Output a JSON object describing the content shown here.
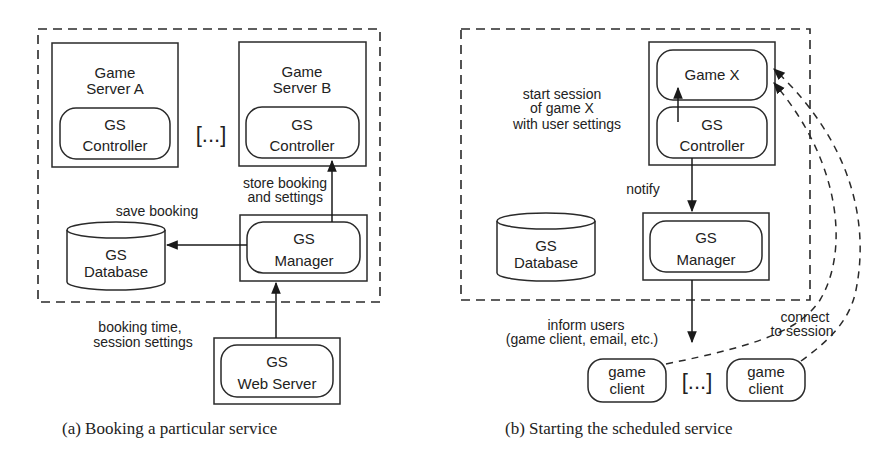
{
  "diagram_a": {
    "caption": "(a) Booking a particular service",
    "game_server_a": {
      "line1": "Game",
      "line2": "Server A",
      "controller_line1": "GS",
      "controller_line2": "Controller"
    },
    "ellipsis": "[...]",
    "game_server_b": {
      "line1": "Game",
      "line2": "Server B",
      "controller_line1": "GS",
      "controller_line2": "Controller"
    },
    "database": {
      "line1": "GS",
      "line2": "Database"
    },
    "manager": {
      "line1": "GS",
      "line2": "Manager"
    },
    "web_server": {
      "line1": "GS",
      "line2": "Web Server"
    },
    "edges": {
      "store_line1": "store booking",
      "store_line2": "and settings",
      "save": "save booking",
      "booking_line1": "booking time,",
      "booking_line2": "session settings"
    }
  },
  "diagram_b": {
    "caption": "(b) Starting the scheduled service",
    "game_x": "Game X",
    "controller": {
      "line1": "GS",
      "line2": "Controller"
    },
    "database": {
      "line1": "GS",
      "line2": "Database"
    },
    "manager": {
      "line1": "GS",
      "line2": "Manager"
    },
    "clients": [
      {
        "line1": "game",
        "line2": "client"
      },
      {
        "line1": "game",
        "line2": "client"
      }
    ],
    "ellipsis": "[...]",
    "edges": {
      "start_line1": "start session",
      "start_line2": "of game X",
      "start_line3": "with user settings",
      "notify": "notify",
      "inform_line1": "inform users",
      "inform_line2": "(game client, email, etc.)",
      "connect_line1": "connect",
      "connect_line2": "to session"
    }
  },
  "colors": {
    "stroke": "#2a2a2a",
    "text": "#222222",
    "background": "#ffffff"
  }
}
